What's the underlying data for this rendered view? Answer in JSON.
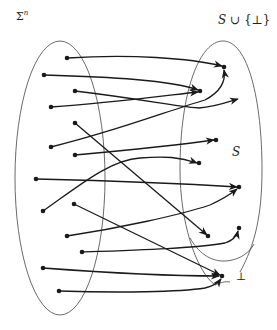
{
  "labels": {
    "domain_set": "Σ",
    "domain_exponent": "n",
    "codomain_set_s": "S",
    "codomain_union": " ∪ {⊥}",
    "subset_s": "S",
    "bottom": "⊥"
  },
  "colors": {
    "ink": "#1a1a1a",
    "outline": "#444444",
    "background": "#ffffff"
  },
  "left_ellipse": {
    "cx": 60,
    "cy": 178,
    "rx": 45,
    "ry": 137
  },
  "domain_points": [
    [
      67,
      58
    ],
    [
      44,
      75
    ],
    [
      75,
      91
    ],
    [
      51,
      107
    ],
    [
      75,
      123
    ],
    [
      51,
      147
    ],
    [
      75,
      155
    ],
    [
      36,
      179
    ],
    [
      74,
      204
    ],
    [
      43,
      211
    ],
    [
      67,
      236
    ],
    [
      82,
      252
    ],
    [
      43,
      268
    ],
    [
      59,
      291
    ]
  ],
  "codomain_points": [
    [
      224,
      67
    ],
    [
      200,
      91
    ],
    [
      216,
      140
    ],
    [
      199,
      163
    ],
    [
      239,
      187
    ],
    [
      208,
      236
    ],
    [
      239,
      228
    ],
    [
      222,
      276
    ]
  ],
  "arrows": [
    {
      "from": [
        67,
        58
      ],
      "to": [
        224,
        67
      ]
    },
    {
      "from": [
        44,
        75
      ],
      "to": [
        200,
        91
      ]
    },
    {
      "from": [
        75,
        91
      ],
      "to": [
        239,
        99
      ]
    },
    {
      "from": [
        51,
        107
      ],
      "to": [
        200,
        91
      ]
    },
    {
      "from": [
        75,
        123
      ],
      "to": [
        208,
        236
      ]
    },
    {
      "from": [
        51,
        147
      ],
      "to": [
        224,
        67
      ]
    },
    {
      "from": [
        75,
        155
      ],
      "to": [
        216,
        140
      ]
    },
    {
      "from": [
        36,
        179
      ],
      "to": [
        239,
        187
      ]
    },
    {
      "from": [
        43,
        211
      ],
      "to": [
        199,
        163
      ]
    },
    {
      "from": [
        74,
        204
      ],
      "to": [
        222,
        276
      ]
    },
    {
      "from": [
        67,
        236
      ],
      "to": [
        239,
        187
      ]
    },
    {
      "from": [
        82,
        252
      ],
      "to": [
        239,
        228
      ]
    },
    {
      "from": [
        43,
        268
      ],
      "to": [
        222,
        276
      ]
    },
    {
      "from": [
        59,
        291
      ],
      "to": [
        222,
        276
      ]
    }
  ]
}
